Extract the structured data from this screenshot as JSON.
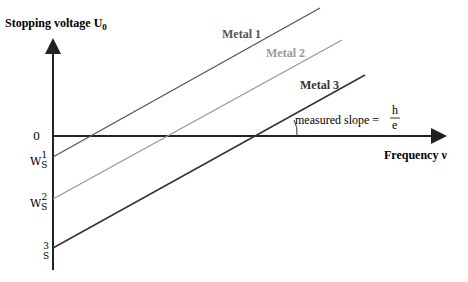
{
  "axes": {
    "y_label": "Stopping voltage U",
    "y_label_sub": "0",
    "x_label": "Frequency ν",
    "origin_label": "0"
  },
  "ticks": [
    {
      "main": "W",
      "sub": "S",
      "sup": "1"
    },
    {
      "main": "W",
      "sub": "S",
      "sup": "2"
    },
    {
      "main": "",
      "sub": "S",
      "sup": "3"
    }
  ],
  "lines": [
    {
      "label": "Metal 1",
      "color": "#555555"
    },
    {
      "label": "Metal 2",
      "color": "#999999"
    },
    {
      "label": "Metal 3",
      "color": "#333333"
    }
  ],
  "annotation": {
    "text": "measured slope =",
    "num": "h",
    "den": "e"
  }
}
